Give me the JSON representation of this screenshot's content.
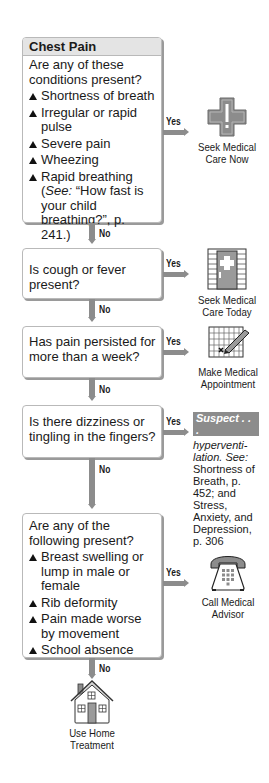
{
  "title": "Chest Pain",
  "connectors": {
    "yes_label": "Yes",
    "no_label": "No"
  },
  "steps": [
    {
      "question": "Are any of these conditions present?",
      "items": [
        "Shortness of breath",
        "Irregular or rapid pulse",
        "Severe pain",
        "Wheezing",
        "Rapid breathing"
      ],
      "see_note_prefix": "(",
      "see_note_see": "See:",
      "see_note_rest": " “How fast is your child breathing?”, p. 241.)",
      "outcome": {
        "label_line1": "Seek Medical",
        "label_line2": "Care Now",
        "icon": "medical-cross-icon"
      }
    },
    {
      "question": "Is cough or fever present?",
      "outcome": {
        "label_line1": "Seek Medical",
        "label_line2": "Care Today",
        "icon": "clinic-door-icon"
      }
    },
    {
      "question": "Has pain persisted for more than a week?",
      "outcome": {
        "label_line1": "Make Medical",
        "label_line2": "Appointment",
        "icon": "calendar-pencil-icon"
      }
    },
    {
      "question": "Is there dizziness or tingling in the fingers?",
      "outcome": {
        "tag": "Suspect . . .",
        "italic_text": "hyperventi-lation. See:",
        "text": "Shortness of Breath, p. 452; and Stress, Anxiety, and Depression, p. 306"
      }
    },
    {
      "question": "Are any of the following present?",
      "items": [
        "Breast swelling or lump in male or female",
        "Rib deformity",
        "Pain made worse by movement",
        "School absence"
      ],
      "outcome": {
        "label_line1": "Call Medical",
        "label_line2": "Advisor",
        "icon": "telephone-icon"
      }
    }
  ],
  "final": {
    "label_line1": "Use Home",
    "label_line2": "Treatment",
    "icon": "house-icon"
  },
  "colors": {
    "connector": "#8c8c8c",
    "header_bg": "#e4e4e4",
    "border": "#b9b9b9"
  }
}
